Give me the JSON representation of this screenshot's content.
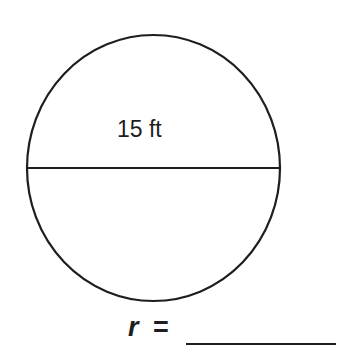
{
  "diagram": {
    "shape": "circle",
    "diameter_label": "15 ft",
    "answer_prompt": {
      "variable": "r",
      "equals": "=",
      "blank": ""
    },
    "colors": {
      "stroke": "#1e1e1e",
      "background": "#ffffff"
    }
  }
}
